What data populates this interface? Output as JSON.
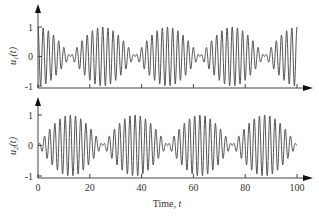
{
  "chart_data": [
    {
      "type": "line",
      "panel": "top",
      "ylabel": "u1(t)",
      "ylabel_main": "u",
      "ylabel_sub": "1",
      "ylabel_arg": "(t)",
      "xlabel": "",
      "xlim": [
        0,
        100
      ],
      "ylim": [
        -1,
        1
      ],
      "yticks": [
        -1,
        0,
        1
      ],
      "ytick_labels": [
        "-1",
        "0",
        "1"
      ],
      "xticks": [
        0,
        20,
        40,
        60,
        80,
        100
      ],
      "xtick_labels": [],
      "grid": false,
      "series": [
        {
          "name": "u1(t)",
          "description": "beat signal: full amplitude at t=0,25,50,75,100; envelope nodes near t=12.5,37.5,62.5,87.5",
          "formula": "cos(pi*t/25)*cos(pi*t)",
          "color": "#555555"
        }
      ]
    },
    {
      "type": "line",
      "panel": "bottom",
      "ylabel": "u2(t)",
      "ylabel_main": "u",
      "ylabel_sub": "2",
      "ylabel_arg": "(t)",
      "xlabel": "Time, t",
      "xlabel_main": "Time, ",
      "xlabel_var": "t",
      "xlim": [
        0,
        100
      ],
      "ylim": [
        -1,
        1
      ],
      "yticks": [
        -1,
        0,
        1
      ],
      "ytick_labels": [
        "-1",
        "0",
        "1"
      ],
      "xticks": [
        0,
        20,
        40,
        60,
        80,
        100
      ],
      "xtick_labels": [
        "0",
        "20",
        "40",
        "60",
        "80",
        "100"
      ],
      "grid": false,
      "series": [
        {
          "name": "u2(t)",
          "description": "complementary beat signal: near zero at t=0,25,50,75,100; full amplitude near t=12.5,37.5,62.5,87.5",
          "formula": "sin(pi*t/25)*sin(pi*t)",
          "color": "#555555"
        }
      ]
    }
  ],
  "sampling": {
    "t_start": 0,
    "t_end": 100,
    "samples": 1200,
    "envelope_period": 25,
    "carrier_omega_rad": 3.14159
  }
}
